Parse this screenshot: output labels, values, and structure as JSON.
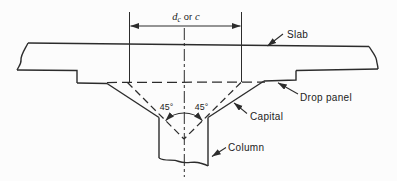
{
  "colors": {
    "line": "#2c2c2c",
    "text": "#222222",
    "background": "#fcfcfc"
  },
  "diagram": {
    "type": "engineering-section",
    "dimension_label": {
      "var1": "d",
      "var1_sub": "c",
      "conjunction": "or",
      "var2": "c"
    },
    "angles": {
      "left": "45°",
      "right": "45°"
    },
    "labels": {
      "slab": "Slab",
      "drop_panel": "Drop panel",
      "capital": "Capital",
      "column": "Column"
    }
  }
}
